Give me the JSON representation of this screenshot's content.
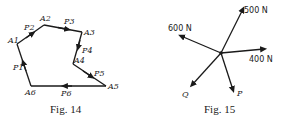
{
  "fig14": {
    "caption": "Fig. 14",
    "vertices": [
      {
        "id": "A1",
        "label": "A1"
      },
      {
        "id": "A2",
        "label": "A2"
      },
      {
        "id": "A3",
        "label": "A3"
      },
      {
        "id": "A4",
        "label": "A4"
      },
      {
        "id": "A5",
        "label": "A5"
      },
      {
        "id": "A6",
        "label": "A6"
      }
    ],
    "edges": [
      {
        "label": "P1",
        "from": "A6",
        "to": "A1"
      },
      {
        "label": "P2",
        "from": "A1",
        "to": "A2"
      },
      {
        "label": "P3",
        "from": "A2",
        "to": "A3"
      },
      {
        "label": "P4",
        "from": "A3",
        "to": "A4"
      },
      {
        "label": "P5",
        "from": "A4",
        "to": "A5"
      },
      {
        "label": "P6",
        "from": "A5",
        "to": "A6"
      }
    ]
  },
  "fig15": {
    "caption": "Fig. 15",
    "forces": [
      {
        "label": "500 N",
        "direction": "up-right"
      },
      {
        "label": "600 N",
        "direction": "up-left"
      },
      {
        "label": "400 N",
        "direction": "right"
      },
      {
        "label": "Q",
        "direction": "down-left"
      },
      {
        "label": "P",
        "direction": "down"
      }
    ]
  }
}
